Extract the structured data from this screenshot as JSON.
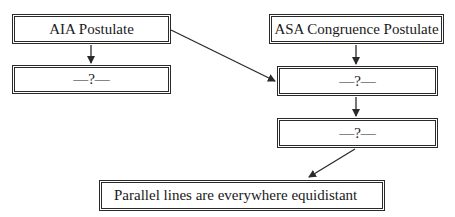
{
  "diagram": {
    "type": "flowchart",
    "nodes": [
      {
        "id": "aia",
        "label": "AIA Postulate"
      },
      {
        "id": "left_unknown",
        "label": "—?—"
      },
      {
        "id": "asa",
        "label": "ASA Congruence Postulate"
      },
      {
        "id": "right_unknown_1",
        "label": "—?—"
      },
      {
        "id": "right_unknown_2",
        "label": "—?—"
      },
      {
        "id": "conclusion",
        "label": "Parallel lines are everywhere equidistant"
      }
    ],
    "edges": [
      {
        "from": "aia",
        "to": "left_unknown"
      },
      {
        "from": "aia",
        "to": "right_unknown_1"
      },
      {
        "from": "asa",
        "to": "right_unknown_1"
      },
      {
        "from": "right_unknown_1",
        "to": "right_unknown_2"
      },
      {
        "from": "right_unknown_2",
        "to": "conclusion"
      }
    ],
    "colors": {
      "line": "#2a2a2a",
      "background": "#ffffff"
    }
  }
}
